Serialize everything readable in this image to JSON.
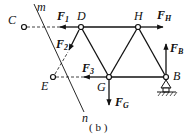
{
  "diagram": {
    "caption": "( b )",
    "section_line": {
      "top_label": "m",
      "bottom_label": "n"
    },
    "nodes": {
      "C": {
        "label": "C"
      },
      "D": {
        "label": "D"
      },
      "H": {
        "label": "H"
      },
      "E": {
        "label": "E"
      },
      "G": {
        "label": "G"
      },
      "B": {
        "label": "B"
      }
    },
    "forces": {
      "F1": {
        "main": "F",
        "sub": "1"
      },
      "F2": {
        "main": "F",
        "sub": "2"
      },
      "F3": {
        "main": "F",
        "sub": "3"
      },
      "FH": {
        "main": "F",
        "sub": "H"
      },
      "FB": {
        "main": "F",
        "sub": "B"
      },
      "FG": {
        "main": "F",
        "sub": "G"
      }
    }
  }
}
